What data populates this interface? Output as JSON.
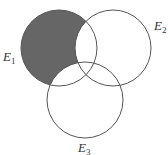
{
  "diagram": {
    "type": "venn",
    "sets": [
      {
        "id": "E1",
        "label": "E",
        "subscript": "1",
        "cx": 59,
        "cy": 48,
        "r": 38,
        "label_pos": [
          3,
          62
        ]
      },
      {
        "id": "E2",
        "label": "E",
        "subscript": "2",
        "cx": 113,
        "cy": 48,
        "r": 38,
        "label_pos": [
          154,
          24
        ]
      },
      {
        "id": "E3",
        "label": "E",
        "subscript": "3",
        "cx": 85,
        "cy": 100,
        "r": 38,
        "label_pos": [
          78,
          140
        ]
      }
    ],
    "shaded_region": "E1 only (E1 ∩ E2ᶜ ∩ E3ᶜ)",
    "colors": {
      "stroke": "#555555",
      "fill_shaded": "#666666",
      "background": "#ffffff"
    }
  }
}
